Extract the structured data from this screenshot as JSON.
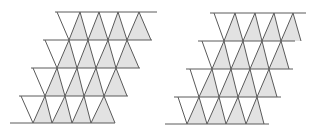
{
  "colors": {
    "background": "#ffffff",
    "line": "#5a5a5a",
    "fill": "#e2e2e2"
  },
  "figures": [
    {
      "name": "left-tessellation",
      "rows": [
        {
          "top": 12,
          "bottom": 40,
          "line_top": [
            55,
            157
          ],
          "apexes": [
            57,
            80,
            99,
            118,
            139
          ],
          "bases": [
            69,
            88,
            108,
            127,
            151
          ]
        },
        {
          "top": 40,
          "bottom": 68,
          "line_top": [
            43,
            152
          ],
          "apexes": [
            45,
            69,
            88,
            108,
            127
          ],
          "bases": [
            57,
            77,
            96,
            116,
            139
          ]
        },
        {
          "top": 68,
          "bottom": 96,
          "line_top": [
            31,
            140
          ],
          "apexes": [
            33,
            57,
            77,
            96,
            116
          ],
          "bases": [
            45,
            65,
            84,
            104,
            127
          ]
        },
        {
          "top": 96,
          "bottom": 123,
          "line_top": [
            19,
            128
          ],
          "apexes": [
            21,
            45,
            65,
            84,
            104
          ],
          "bases": [
            33,
            52,
            72,
            91,
            115
          ]
        }
      ],
      "bottom_line": {
        "y": 123,
        "x": [
          10,
          115
        ]
      }
    },
    {
      "name": "right-tessellation",
      "rows": [
        {
          "top": 13,
          "bottom": 41,
          "line_top": [
            210,
            306
          ],
          "apexes": [
            214,
            235,
            255,
            274,
            293
          ],
          "bases": [
            224,
            243,
            262,
            281,
            301
          ]
        },
        {
          "top": 41,
          "bottom": 69,
          "line_top": [
            198,
            295
          ],
          "apexes": [
            202,
            224,
            243,
            262,
            281
          ],
          "bases": [
            212,
            231,
            250,
            269,
            289
          ]
        },
        {
          "top": 69,
          "bottom": 97,
          "line_top": [
            186,
            293
          ],
          "apexes": [
            190,
            212,
            231,
            250,
            269
          ],
          "bases": [
            199,
            219,
            238,
            257,
            277
          ]
        },
        {
          "top": 97,
          "bottom": 124,
          "line_top": [
            174,
            281
          ],
          "apexes": [
            178,
            199,
            219,
            238,
            257
          ],
          "bases": [
            187,
            207,
            226,
            246,
            264
          ]
        }
      ],
      "bottom_line": {
        "y": 124,
        "x": [
          165,
          269
        ]
      }
    }
  ]
}
